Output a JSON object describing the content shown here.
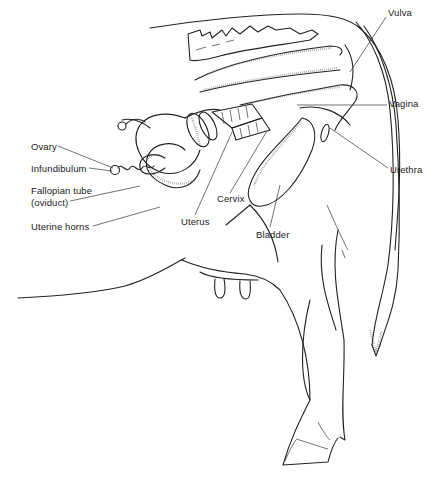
{
  "figure": {
    "labels": [
      {
        "id": "vulva",
        "text": "Vulva",
        "x": 388,
        "y": 13
      },
      {
        "id": "vagina",
        "text": "Vagina",
        "x": 389,
        "y": 101
      },
      {
        "id": "ovary",
        "text": "Ovary",
        "x": 31,
        "y": 142
      },
      {
        "id": "infundibulum",
        "text": "Infundibulum",
        "x": 31,
        "y": 164
      },
      {
        "id": "fallopian-tube",
        "text": "Fallopian tube",
        "x": 31,
        "y": 185
      },
      {
        "id": "oviduct",
        "text": "(oviduct)",
        "x": 31,
        "y": 198
      },
      {
        "id": "urethra",
        "text": "Urethra",
        "x": 390,
        "y": 165
      },
      {
        "id": "uterine-horns",
        "text": "Uterine horns",
        "x": 31,
        "y": 222
      },
      {
        "id": "cervix",
        "text": "Cervix",
        "x": 217,
        "y": 195
      },
      {
        "id": "uterus",
        "text": "Uterus",
        "x": 181,
        "y": 218
      },
      {
        "id": "bladder",
        "text": "Bladder",
        "x": 256,
        "y": 230
      }
    ]
  },
  "colors": {
    "ink": "#1a1a1a",
    "background": "#ffffff"
  }
}
